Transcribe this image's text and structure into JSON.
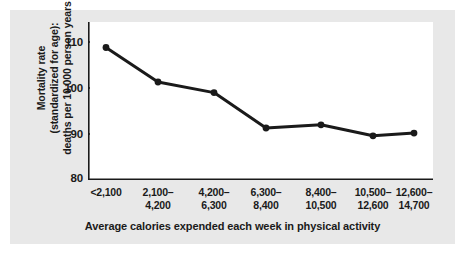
{
  "chart_data": {
    "type": "line",
    "title": "",
    "subtitle": "",
    "xlabel": "Average calories expended each week in physical activity",
    "ylabel": "Mortality rate (standardized for age): deaths per 10,000 person years",
    "ylabel_lines": [
      "Mortality rate",
      "(standardized for age):",
      "deaths per 10,000 person years"
    ],
    "categories": [
      "<2,100",
      "2,100–4,200",
      "4,200–6,300",
      "6,300–8,400",
      "8,400–10,500",
      "10,500–12,600",
      "12,600–14,700"
    ],
    "category_lines": [
      [
        "<2,100",
        ""
      ],
      [
        "2,100–",
        "4,200"
      ],
      [
        "4,200–",
        "6,300"
      ],
      [
        "6,300–",
        "8,400"
      ],
      [
        "8,400–",
        "10,500"
      ],
      [
        "10,500–",
        "12,600"
      ],
      [
        "12,600–",
        "14,700"
      ]
    ],
    "values": [
      108.8,
      101.3,
      99.0,
      91.3,
      92.0,
      89.6,
      90.2
    ],
    "series": [
      {
        "name": "Mortality rate",
        "values": [
          108.8,
          101.3,
          99.0,
          91.3,
          92.0,
          89.6,
          90.2
        ]
      }
    ],
    "ylim": [
      80,
      112
    ],
    "yticks": [
      80,
      90,
      100,
      110
    ],
    "ytick_labels": [
      "80",
      "90",
      "100",
      "110"
    ],
    "grid": false,
    "legend": false,
    "legend_position": "none",
    "line_color": "#1a1a1a",
    "marker_color": "#1a1a1a",
    "plot_background": "#ffffff",
    "figure_background": "#e8e8e8"
  }
}
